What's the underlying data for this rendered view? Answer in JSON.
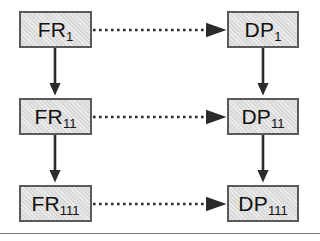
{
  "diagram": {
    "type": "zigzag-decomposition",
    "background_color": "#ffffff",
    "node_fill_color": "#d9d9d9",
    "node_border_color": "#5a5a5a",
    "arrow_color": "#2b2b2b",
    "columns": [
      {
        "id": "fr-column",
        "name": "FR"
      },
      {
        "id": "dp-column",
        "name": "DP"
      }
    ],
    "levels": [
      {
        "id": "level-1",
        "index": 1
      },
      {
        "id": "level-2",
        "index": 2
      },
      {
        "id": "level-3",
        "index": 3
      }
    ],
    "nodes": [
      {
        "id": "fr-1",
        "base": "FR",
        "subscript": "1",
        "column": "FR",
        "level": 1,
        "x": 19,
        "y": 11,
        "w": 73,
        "h": 37
      },
      {
        "id": "dp-1",
        "base": "DP",
        "subscript": "1",
        "column": "DP",
        "level": 1,
        "x": 227,
        "y": 11,
        "w": 72,
        "h": 37
      },
      {
        "id": "fr-11",
        "base": "FR",
        "subscript": "11",
        "column": "FR",
        "level": 2,
        "x": 19,
        "y": 98,
        "w": 73,
        "h": 37
      },
      {
        "id": "dp-11",
        "base": "DP",
        "subscript": "11",
        "column": "DP",
        "level": 2,
        "x": 227,
        "y": 98,
        "w": 72,
        "h": 37
      },
      {
        "id": "fr-111",
        "base": "FR",
        "subscript": "111",
        "column": "FR",
        "level": 3,
        "x": 19,
        "y": 185,
        "w": 73,
        "h": 37
      },
      {
        "id": "dp-111",
        "base": "DP",
        "subscript": "111",
        "column": "DP",
        "level": 3,
        "x": 227,
        "y": 185,
        "w": 72,
        "h": 37
      }
    ],
    "mapping_arrows": [
      {
        "id": "map-1",
        "from": "fr-1",
        "to": "dp-1",
        "style": "dotted",
        "head": "wide-triangle"
      },
      {
        "id": "map-11",
        "from": "fr-11",
        "to": "dp-11",
        "style": "dotted",
        "head": "wide-triangle"
      },
      {
        "id": "map-111",
        "from": "fr-111",
        "to": "dp-111",
        "style": "dotted",
        "head": "wide-triangle"
      }
    ],
    "decomposition_arrows": [
      {
        "id": "dec-fr-1-11",
        "from": "fr-1",
        "to": "fr-11",
        "style": "solid",
        "head": "narrow-triangle"
      },
      {
        "id": "dec-fr-11-111",
        "from": "fr-11",
        "to": "fr-111",
        "style": "solid",
        "head": "narrow-triangle"
      },
      {
        "id": "dec-dp-1-11",
        "from": "dp-1",
        "to": "dp-11",
        "style": "solid",
        "head": "narrow-triangle"
      },
      {
        "id": "dec-dp-11-111",
        "from": "dp-11",
        "to": "dp-111",
        "style": "solid",
        "head": "narrow-triangle"
      }
    ],
    "baseline_rule": {
      "id": "baseline-rule",
      "y": 233,
      "color": "#7a7a7a"
    }
  }
}
